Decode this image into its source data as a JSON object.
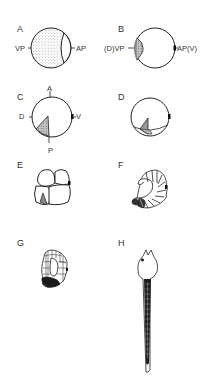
{
  "figure": {
    "panels": [
      {
        "id": "A",
        "label": "A",
        "annotations": {
          "left": "VP",
          "right": "AP"
        }
      },
      {
        "id": "B",
        "label": "B",
        "annotations": {
          "left": "(D)VP",
          "right": "AP(V)"
        }
      },
      {
        "id": "C",
        "label": "C",
        "annotations": {
          "top": "A",
          "left": "D",
          "right": "V",
          "bottom": "P"
        }
      },
      {
        "id": "D",
        "label": "D",
        "annotations": {}
      },
      {
        "id": "E",
        "label": "E",
        "annotations": {}
      },
      {
        "id": "F",
        "label": "F",
        "annotations": {}
      },
      {
        "id": "G",
        "label": "G",
        "annotations": {}
      },
      {
        "id": "H",
        "label": "H",
        "annotations": {}
      }
    ],
    "colors": {
      "ink": "#222222",
      "stipple": "#9a9a9a",
      "shade": "#b0b0b0",
      "dark": "#1a1a1a",
      "background": "#ffffff"
    }
  }
}
